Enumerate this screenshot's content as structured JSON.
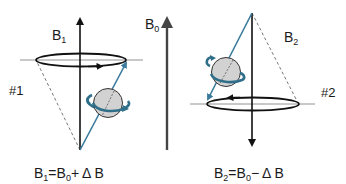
{
  "diagram": {
    "left_panel": {
      "field_label": "B",
      "field_sub": "1",
      "tag": "#1",
      "equation": {
        "lhs": "B",
        "lhs_sub": "1",
        "eq": "=",
        "b0": "B",
        "b0_sub": "0",
        "op": "+",
        "delta": "Δ B"
      }
    },
    "center": {
      "field_label": "B",
      "field_sub": "0"
    },
    "right_panel": {
      "field_label": "B",
      "field_sub": "2",
      "tag": "#2",
      "equation": {
        "lhs": "B",
        "lhs_sub": "2",
        "eq": "=",
        "b0": "B",
        "b0_sub": "0",
        "op": "−",
        "delta": "Δ B"
      }
    },
    "colors": {
      "axis": "#111111",
      "b0_arrow": "#444444",
      "spin_vector": "#3a7a9c",
      "sphere_fill": "#d2d2d2",
      "spin_arrow": "#2f6f8a",
      "dashed": "#666666"
    }
  }
}
